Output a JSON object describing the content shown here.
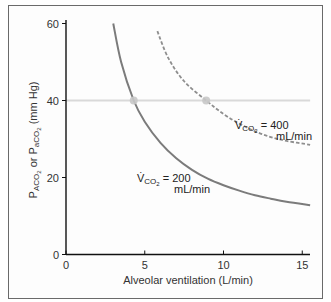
{
  "chart_data": {
    "type": "line",
    "title": "",
    "xlabel": "Alveolar ventilation (L/min)",
    "ylabel": "PACO2 or PaCO2 (mm Hg)",
    "xlim": [
      0,
      15.5
    ],
    "ylim": [
      0,
      60
    ],
    "xticks": [
      0,
      5,
      10,
      15
    ],
    "yticks": [
      0,
      20,
      40,
      60
    ],
    "grid": false,
    "reference_line": {
      "y": 40,
      "color": "#d8d8d8"
    },
    "series": [
      {
        "name": "VCO2 = 200 mL/min",
        "style": "solid",
        "color": "#7a7a7a",
        "x": [
          3.0,
          3.5,
          4.3,
          5,
          6,
          7,
          8,
          9,
          10,
          11,
          12,
          13,
          14,
          15.5
        ],
        "y": [
          60,
          50,
          40,
          34.5,
          29,
          25,
          22,
          19.7,
          18,
          16.6,
          15.4,
          14.5,
          13.7,
          12.8
        ]
      },
      {
        "name": "VCO2 = 400 mL/min",
        "style": "dashed",
        "color": "#8a8a8a",
        "x": [
          5.8,
          6.5,
          7.5,
          8.9,
          10,
          11,
          12,
          13,
          14,
          15.5
        ],
        "y": [
          58,
          51,
          45,
          40,
          36.5,
          34,
          32,
          30.5,
          29.5,
          28.5
        ]
      }
    ],
    "markers": [
      {
        "x": 4.3,
        "y": 40
      },
      {
        "x": 8.9,
        "y": 40
      }
    ],
    "annotations": [
      {
        "text_main": "V̇CO2 = 200",
        "text_sub": "mL/min",
        "x": 4.2,
        "y": 20
      },
      {
        "text_main": "V̇CO2 = 400",
        "text_sub": "mL/min",
        "x": 9.0,
        "y": 32
      }
    ]
  },
  "labels": {
    "y_axis_title_a": "P",
    "y_axis_title_a_sub": "ACO",
    "y_axis_title_a_sub2": "2",
    "y_axis_title_or": " or P",
    "y_axis_title_b_sub": "aCO",
    "y_axis_title_b_sub2": "2",
    "y_axis_title_units": " (mm Hg)",
    "x_axis_title": "Alveolar ventilation (L/min)",
    "ann_200_v": "V̇",
    "ann_200_sub": "CO",
    "ann_200_sub2": "2",
    "ann_200_val": " = 200",
    "ann_200_units": "mL/min",
    "ann_400_v": "V̇",
    "ann_400_sub": "CO",
    "ann_400_sub2": "2",
    "ann_400_val": " = 400",
    "ann_400_units": "mL/min"
  }
}
